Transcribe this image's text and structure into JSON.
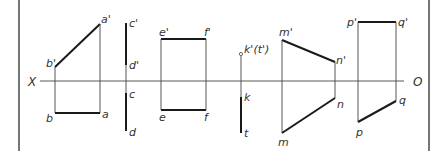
{
  "diagram": {
    "axis": {
      "left_label": "X",
      "right_label": "O"
    },
    "labels": {
      "a_prime": "a'",
      "b_prime": "b'",
      "a": "a",
      "b": "b",
      "c_prime": "c'",
      "d_prime": "d'",
      "c": "c",
      "d": "d",
      "e_prime": "e'",
      "f_prime": "f'",
      "e": "e",
      "f": "f",
      "k_prime_t_prime": "k'(t')",
      "k": "k",
      "t": "t",
      "m_prime": "m'",
      "n_prime": "n'",
      "m": "m",
      "n": "n",
      "p_prime": "p'",
      "q_prime": "q'",
      "p": "p",
      "q": "q"
    },
    "segments": [
      {
        "name": "AB",
        "front": "a'b'",
        "top": "ab"
      },
      {
        "name": "CD",
        "front": "c'd'",
        "top": "cd"
      },
      {
        "name": "EF",
        "front": "e'f'",
        "top": "ef"
      },
      {
        "name": "KT",
        "front": "k'(t')",
        "top": "kt"
      },
      {
        "name": "MN",
        "front": "m'n'",
        "top": "mn"
      },
      {
        "name": "PQ",
        "front": "p'q'",
        "top": "pq"
      }
    ]
  }
}
